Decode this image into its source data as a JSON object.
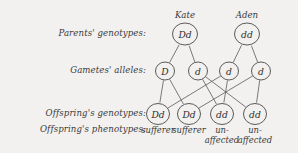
{
  "diagram": {
    "row_labels": [
      "Parents' genotypes:",
      "Gametes' alleles:",
      "Offspring's genotypes:",
      "Offspring's phenotypes:"
    ],
    "parents": [
      {
        "name": "Kate",
        "genotype": "Dd",
        "cx": 185,
        "cy": 34
      },
      {
        "name": "Aden",
        "genotype": "dd",
        "cx": 247,
        "cy": 34
      }
    ],
    "gametes": [
      {
        "allele": "D",
        "cx": 165,
        "cy": 71,
        "parent": 0
      },
      {
        "allele": "d",
        "cx": 198,
        "cy": 71,
        "parent": 0
      },
      {
        "allele": "d",
        "cx": 229,
        "cy": 71,
        "parent": 1
      },
      {
        "allele": "d",
        "cx": 261,
        "cy": 71,
        "parent": 1
      }
    ],
    "offspring": [
      {
        "genotype": "Dd",
        "phenotype_lines": [
          "sufferer"
        ],
        "cx": 158,
        "cy": 114
      },
      {
        "genotype": "Dd",
        "phenotype_lines": [
          "sufferer"
        ],
        "cx": 189,
        "cy": 114
      },
      {
        "genotype": "dd",
        "phenotype_lines": [
          "un-",
          "affected"
        ],
        "cx": 222,
        "cy": 114
      },
      {
        "genotype": "dd",
        "phenotype_lines": [
          "un-",
          "affected"
        ],
        "cx": 255,
        "cy": 114
      }
    ],
    "cross_links": [
      {
        "from_gamete": 0,
        "to_offspring": 0
      },
      {
        "from_gamete": 0,
        "to_offspring": 1
      },
      {
        "from_gamete": 1,
        "to_offspring": 2
      },
      {
        "from_gamete": 1,
        "to_offspring": 3
      },
      {
        "from_gamete": 2,
        "to_offspring": 0
      },
      {
        "from_gamete": 2,
        "to_offspring": 2
      },
      {
        "from_gamete": 3,
        "to_offspring": 1
      },
      {
        "from_gamete": 3,
        "to_offspring": 3
      }
    ],
    "geometry": {
      "parent_radius": 12.5,
      "gamete_radius": 9.5,
      "offspring_radius": 11.5
    },
    "colors": {
      "background": "#f2f1ef",
      "stroke": "#4a4a4a",
      "link": "#5a5a5a",
      "text": "#3a3a3a"
    },
    "label_positions": [
      34,
      71,
      114,
      130
    ]
  }
}
